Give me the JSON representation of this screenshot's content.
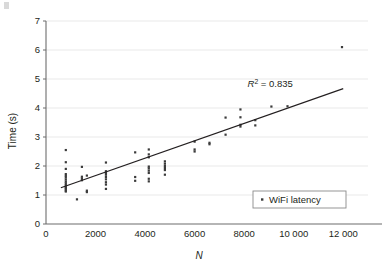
{
  "chart_data": {
    "type": "scatter",
    "title": "",
    "xlabel": "N",
    "ylabel": "Time (s)",
    "xlim": [
      0,
      13000
    ],
    "ylim": [
      0,
      7
    ],
    "grid": "horizontal",
    "x_ticks": [
      0,
      2000,
      4000,
      6000,
      8000,
      10000,
      12000
    ],
    "x_tick_labels": [
      "0",
      "2000",
      "4000",
      "6000",
      "8000",
      "10 000",
      "12 000"
    ],
    "y_ticks": [
      0,
      1,
      2,
      3,
      4,
      5,
      6,
      7
    ],
    "y_tick_labels": [
      "0",
      "1",
      "2",
      "3",
      "4",
      "5",
      "6",
      "7"
    ],
    "legend": {
      "position": "bottom-right",
      "entries": [
        {
          "label": "WiFi latency",
          "marker": "dot",
          "color": "#3b3b3b"
        }
      ]
    },
    "annotations": [
      {
        "text_italic": "R",
        "superscript": "2",
        "text": " = 0.835",
        "full_text": "R2 = 0.835",
        "x": 9050,
        "y": 4.72
      }
    ],
    "trendline": {
      "type": "linear",
      "r_squared": 0.835,
      "x_start": 600,
      "y_start": 1.25,
      "x_end": 12000,
      "y_end": 4.67,
      "color": "#231f20"
    },
    "series": [
      {
        "name": "WiFi latency",
        "color": "#3b3b3b",
        "points": [
          [
            800,
            2.55
          ],
          [
            800,
            2.13
          ],
          [
            800,
            1.9
          ],
          [
            800,
            1.72
          ],
          [
            800,
            1.66
          ],
          [
            800,
            1.6
          ],
          [
            800,
            1.53
          ],
          [
            800,
            1.46
          ],
          [
            800,
            1.4
          ],
          [
            800,
            1.34
          ],
          [
            800,
            1.28
          ],
          [
            800,
            1.24
          ],
          [
            800,
            1.2
          ],
          [
            800,
            1.15
          ],
          [
            800,
            1.12
          ],
          [
            1250,
            0.85
          ],
          [
            1450,
            1.97
          ],
          [
            1450,
            1.63
          ],
          [
            1450,
            1.57
          ],
          [
            1450,
            1.51
          ],
          [
            1650,
            1.67
          ],
          [
            1650,
            1.15
          ],
          [
            1650,
            1.1
          ],
          [
            2420,
            2.12
          ],
          [
            2420,
            1.82
          ],
          [
            2420,
            1.76
          ],
          [
            2420,
            1.7
          ],
          [
            2420,
            1.62
          ],
          [
            2420,
            1.54
          ],
          [
            2420,
            1.44
          ],
          [
            2420,
            1.36
          ],
          [
            2420,
            1.21
          ],
          [
            3600,
            2.47
          ],
          [
            3600,
            1.62
          ],
          [
            3600,
            1.49
          ],
          [
            4150,
            2.57
          ],
          [
            4150,
            2.4
          ],
          [
            4150,
            2.3
          ],
          [
            4150,
            1.98
          ],
          [
            4150,
            1.92
          ],
          [
            4150,
            1.84
          ],
          [
            4150,
            1.76
          ],
          [
            4150,
            1.56
          ],
          [
            4150,
            1.47
          ],
          [
            4800,
            2.16
          ],
          [
            4800,
            2.08
          ],
          [
            4800,
            2.0
          ],
          [
            4800,
            1.93
          ],
          [
            4800,
            1.86
          ],
          [
            4800,
            1.7
          ],
          [
            6000,
            2.84
          ],
          [
            6000,
            2.57
          ],
          [
            6000,
            2.5
          ],
          [
            6600,
            2.8
          ],
          [
            6600,
            2.75
          ],
          [
            7250,
            3.67
          ],
          [
            7250,
            3.08
          ],
          [
            7850,
            3.95
          ],
          [
            7850,
            3.68
          ],
          [
            7850,
            3.42
          ],
          [
            7850,
            3.36
          ],
          [
            8450,
            3.58
          ],
          [
            8450,
            3.4
          ],
          [
            9100,
            4.05
          ],
          [
            9750,
            4.06
          ],
          [
            11950,
            6.1
          ]
        ]
      }
    ]
  }
}
